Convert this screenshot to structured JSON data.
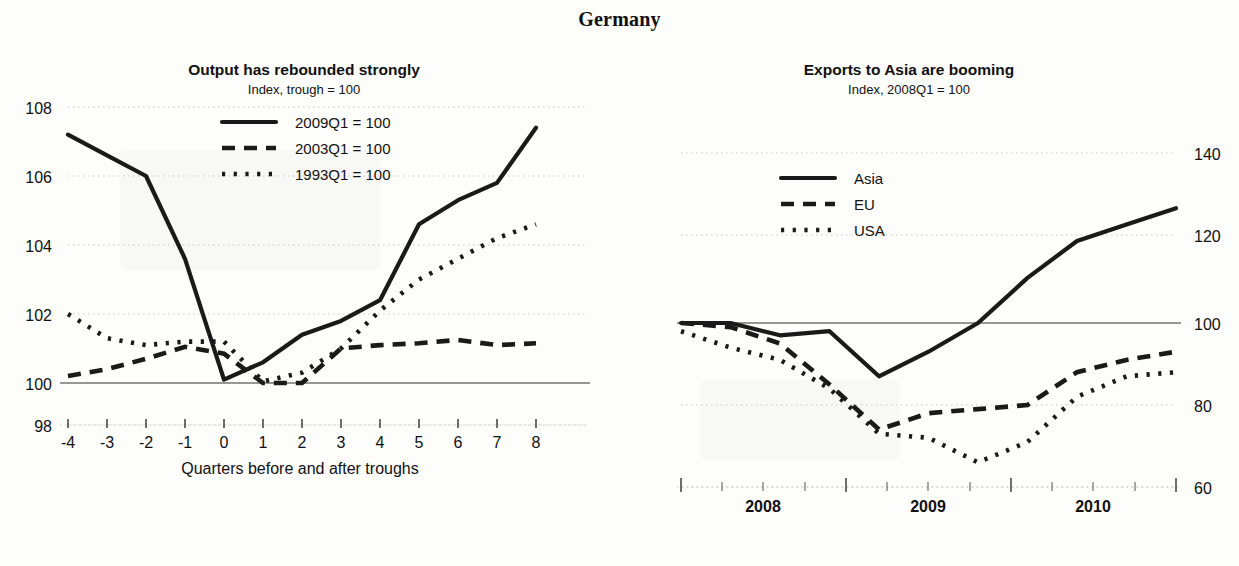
{
  "page": {
    "title": "Germany"
  },
  "left": {
    "title": "Output has rebounded strongly",
    "subtitle": "Index, trough = 100",
    "xlabel": "Quarters before and after troughs",
    "ylabels": [
      "108",
      "106",
      "104",
      "102",
      "100",
      "98"
    ],
    "xlabels": [
      "-4",
      "-3",
      "-2",
      "-1",
      "0",
      "1",
      "2",
      "3",
      "4",
      "5",
      "6",
      "7",
      "8"
    ],
    "legend": [
      {
        "label": "2009Q1 = 100",
        "style": "solid"
      },
      {
        "label": "2003Q1 = 100",
        "style": "dashed"
      },
      {
        "label": "1993Q1 = 100",
        "style": "dotted"
      }
    ]
  },
  "right": {
    "title": "Exports to Asia are booming",
    "subtitle": "Index, 2008Q1 = 100",
    "ylabels": [
      "140",
      "120",
      "100",
      "80",
      "60"
    ],
    "xlabels": [
      "2008",
      "2009",
      "2010"
    ],
    "legend": [
      {
        "label": "Asia",
        "style": "solid"
      },
      {
        "label": "EU",
        "style": "dashed"
      },
      {
        "label": "USA",
        "style": "dotted"
      }
    ]
  },
  "chart_data": [
    {
      "type": "line",
      "panel": "left",
      "title": "Output has rebounded strongly",
      "subtitle": "Index, trough = 100",
      "xlabel": "Quarters before and after troughs",
      "ylabel": "Index, trough = 100",
      "xlim": [
        -4.4,
        8.6
      ],
      "ylim": [
        98,
        108
      ],
      "yticks": [
        98,
        100,
        102,
        104,
        106,
        108
      ],
      "xticks": [
        -4,
        -3,
        -2,
        -1,
        0,
        1,
        2,
        3,
        4,
        5,
        6,
        7,
        8
      ],
      "grid": true,
      "reference_line": 100,
      "legend_position": "upper-center",
      "x": [
        -4,
        -3,
        -2,
        -1,
        0,
        1,
        2,
        3,
        4,
        5,
        6,
        7,
        8
      ],
      "series": [
        {
          "name": "2009Q1 = 100",
          "style": "solid",
          "values": [
            107.2,
            106.6,
            106.0,
            103.6,
            100.1,
            100.6,
            101.4,
            101.8,
            102.4,
            104.6,
            105.3,
            105.8,
            107.4
          ]
        },
        {
          "name": "2003Q1 = 100",
          "style": "dashed",
          "values": [
            100.2,
            100.4,
            100.7,
            101.05,
            100.85,
            100.0,
            100.0,
            101.0,
            101.1,
            101.15,
            101.25,
            101.1,
            101.15
          ]
        },
        {
          "name": "1993Q1 = 100",
          "style": "dotted",
          "values": [
            102.0,
            101.3,
            101.1,
            101.2,
            101.2,
            100.05,
            100.3,
            101.0,
            102.1,
            103.0,
            103.6,
            104.2,
            104.6
          ]
        }
      ]
    },
    {
      "type": "line",
      "panel": "right",
      "title": "Exports to Asia are booming",
      "subtitle": "Index, 2008Q1 = 100",
      "xlabel": "",
      "ylabel": "Index, 2008Q1 = 100",
      "xlim": [
        2007.9,
        2010.8
      ],
      "ylim": [
        60,
        140
      ],
      "yticks": [
        60,
        80,
        100,
        120,
        140
      ],
      "xticks": [
        2008,
        2009,
        2010
      ],
      "grid": true,
      "reference_line": 100,
      "yaxis_side": "right",
      "legend_position": "upper-left",
      "x": [
        "2008Q1",
        "2008Q2",
        "2008Q3",
        "2008Q4",
        "2009Q1",
        "2009Q2",
        "2009Q3",
        "2009Q4",
        "2010Q1",
        "2010Q2",
        "2010Q3"
      ],
      "series": [
        {
          "name": "Asia",
          "style": "solid",
          "values": [
            100,
            100,
            97,
            98,
            87,
            93,
            100,
            111,
            120,
            124,
            128
          ]
        },
        {
          "name": "EU",
          "style": "dashed",
          "values": [
            100,
            99,
            95,
            85,
            74,
            78,
            79,
            80,
            88,
            91,
            93
          ]
        },
        {
          "name": "USA",
          "style": "dotted",
          "values": [
            98,
            94,
            91,
            84,
            73,
            72,
            66,
            71,
            82,
            87,
            88
          ]
        }
      ]
    }
  ]
}
